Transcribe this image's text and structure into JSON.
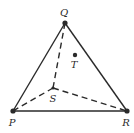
{
  "diagram": {
    "type": "triangle-with-interior-point",
    "points": {
      "Q": {
        "label": "Q",
        "x": 65,
        "y": 23,
        "label_x": 64,
        "label_y": 16
      },
      "P": {
        "label": "P",
        "x": 13,
        "y": 111,
        "label_x": 12,
        "label_y": 126
      },
      "R": {
        "label": "R",
        "x": 127,
        "y": 111,
        "label_x": 126,
        "label_y": 126
      },
      "S": {
        "label": "S",
        "x": 53,
        "y": 88,
        "label_x": 53,
        "label_y": 102
      },
      "T": {
        "label": "T",
        "x": 75,
        "y": 55,
        "label_x": 74,
        "label_y": 68
      }
    },
    "solid_edges": [
      [
        "Q",
        "P"
      ],
      [
        "Q",
        "R"
      ],
      [
        "P",
        "R"
      ]
    ],
    "dashed_edges": [
      [
        "Q",
        "S"
      ],
      [
        "S",
        "P"
      ],
      [
        "S",
        "R"
      ]
    ],
    "colors": {
      "line": "#2a2a2a",
      "point": "#2a2a2a",
      "background": "#ffffff"
    }
  }
}
